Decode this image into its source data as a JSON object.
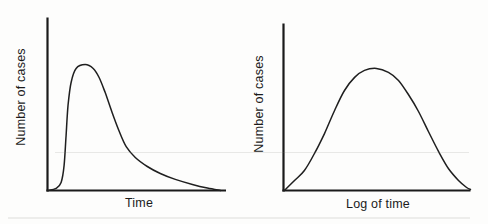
{
  "style": {
    "background": "#fdfdfc",
    "axis_color": "#1a1a1a",
    "curve_color": "#1f1f1f",
    "text_color": "#1b1b1b"
  },
  "chart_data": [
    {
      "type": "line",
      "title": "",
      "xlabel": "Time",
      "ylabel": "Number of cases",
      "xlim": [
        0,
        1
      ],
      "ylim": [
        0,
        1
      ],
      "grid": false,
      "legend": null,
      "tick_labels": "none",
      "curve_points": [
        [
          0.003,
          0.0
        ],
        [
          0.048,
          0.012
        ],
        [
          0.076,
          0.046
        ],
        [
          0.093,
          0.145
        ],
        [
          0.104,
          0.318
        ],
        [
          0.115,
          0.491
        ],
        [
          0.132,
          0.624
        ],
        [
          0.16,
          0.705
        ],
        [
          0.211,
          0.728
        ],
        [
          0.256,
          0.705
        ],
        [
          0.289,
          0.653
        ],
        [
          0.323,
          0.566
        ],
        [
          0.362,
          0.451
        ],
        [
          0.402,
          0.341
        ],
        [
          0.441,
          0.254
        ],
        [
          0.492,
          0.191
        ],
        [
          0.559,
          0.139
        ],
        [
          0.632,
          0.098
        ],
        [
          0.716,
          0.064
        ],
        [
          0.812,
          0.035
        ],
        [
          0.896,
          0.014
        ],
        [
          0.969,
          0.0
        ]
      ]
    },
    {
      "type": "line",
      "title": "",
      "xlabel": "Log of time",
      "ylabel": "Number of cases",
      "xlim": [
        0,
        1
      ],
      "ylim": [
        0,
        1
      ],
      "grid": false,
      "legend": null,
      "tick_labels": "none",
      "curve_points": [
        [
          0.005,
          0.0
        ],
        [
          0.059,
          0.06
        ],
        [
          0.112,
          0.12
        ],
        [
          0.166,
          0.222
        ],
        [
          0.219,
          0.341
        ],
        [
          0.273,
          0.479
        ],
        [
          0.326,
          0.599
        ],
        [
          0.38,
          0.677
        ],
        [
          0.433,
          0.719
        ],
        [
          0.497,
          0.731
        ],
        [
          0.561,
          0.707
        ],
        [
          0.615,
          0.659
        ],
        [
          0.668,
          0.575
        ],
        [
          0.722,
          0.473
        ],
        [
          0.775,
          0.353
        ],
        [
          0.829,
          0.234
        ],
        [
          0.882,
          0.132
        ],
        [
          0.936,
          0.06
        ],
        [
          0.979,
          0.018
        ],
        [
          1.0,
          0.006
        ]
      ]
    }
  ]
}
